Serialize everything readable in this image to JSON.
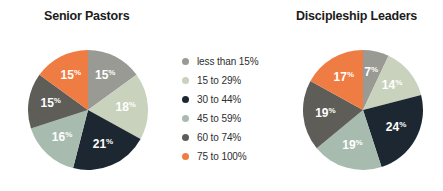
{
  "palette": {
    "c_lt15": "#9a9a95",
    "c_15_29": "#c8d2bc",
    "c_30_44": "#1d2731",
    "c_45_59": "#a7bcae",
    "c_60_74": "#5f5d58",
    "c_75_100": "#ef7d43",
    "label_text": "#ffffff",
    "title_text": "#1b1b1b",
    "legend_text": "#2e2e2e",
    "background": "#ffffff"
  },
  "legend": {
    "items": [
      {
        "label": "less than 15%",
        "color_key": "c_lt15"
      },
      {
        "label": "15 to 29%",
        "color_key": "c_15_29"
      },
      {
        "label": "30 to 44%",
        "color_key": "c_30_44"
      },
      {
        "label": "45 to 59%",
        "color_key": "c_45_59"
      },
      {
        "label": "60 to 74%",
        "color_key": "c_60_74"
      },
      {
        "label": "75 to 100%",
        "color_key": "c_75_100"
      }
    ]
  },
  "chart_data": [
    {
      "type": "pie",
      "title": "Senior Pastors",
      "categories": [
        "less than 15%",
        "15 to 29%",
        "30 to 44%",
        "45 to 59%",
        "60 to 74%",
        "75 to 100%"
      ],
      "values": [
        15,
        18,
        21,
        16,
        15,
        15
      ],
      "labels": [
        "15%",
        "18%",
        "21%",
        "16%",
        "15%",
        "15%"
      ],
      "colors": [
        "#9a9a95",
        "#c8d2bc",
        "#1d2731",
        "#a7bcae",
        "#5f5d58",
        "#ef7d43"
      ],
      "start_angle_deg": 0,
      "direction": "clockwise",
      "legend_position": "center",
      "grid": false
    },
    {
      "type": "pie",
      "title": "Discipleship Leaders",
      "categories": [
        "less than 15%",
        "15 to 29%",
        "30 to 44%",
        "45 to 59%",
        "60 to 74%",
        "75 to 100%"
      ],
      "values": [
        7,
        14,
        24,
        19,
        19,
        17
      ],
      "labels": [
        "7%",
        "14%",
        "24%",
        "19%",
        "19%",
        "17%"
      ],
      "colors": [
        "#9a9a95",
        "#c8d2bc",
        "#1d2731",
        "#a7bcae",
        "#5f5d58",
        "#ef7d43"
      ],
      "start_angle_deg": 0,
      "direction": "clockwise",
      "legend_position": "center",
      "grid": false
    }
  ]
}
